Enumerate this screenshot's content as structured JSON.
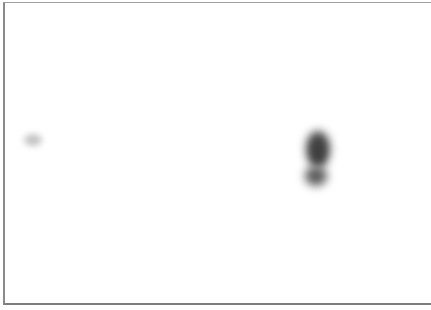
{
  "image": {
    "kind": "blot",
    "width": 431,
    "height": 310,
    "background_color": "#ffffff",
    "border_color": "#8a8a8a"
  },
  "bands": [
    {
      "name": "left-faint-spot",
      "center_x": 33,
      "center_y": 140,
      "width": 18,
      "height": 12,
      "color": "#c8c8c8",
      "intensity": "faint"
    },
    {
      "name": "right-band-upper",
      "center_x": 318,
      "center_y": 148,
      "width": 24,
      "height": 34,
      "color": "#4a4a4a",
      "intensity": "strong"
    },
    {
      "name": "right-band-lower",
      "center_x": 316,
      "center_y": 176,
      "width": 22,
      "height": 18,
      "color": "#5a5a5a",
      "intensity": "strong"
    }
  ]
}
